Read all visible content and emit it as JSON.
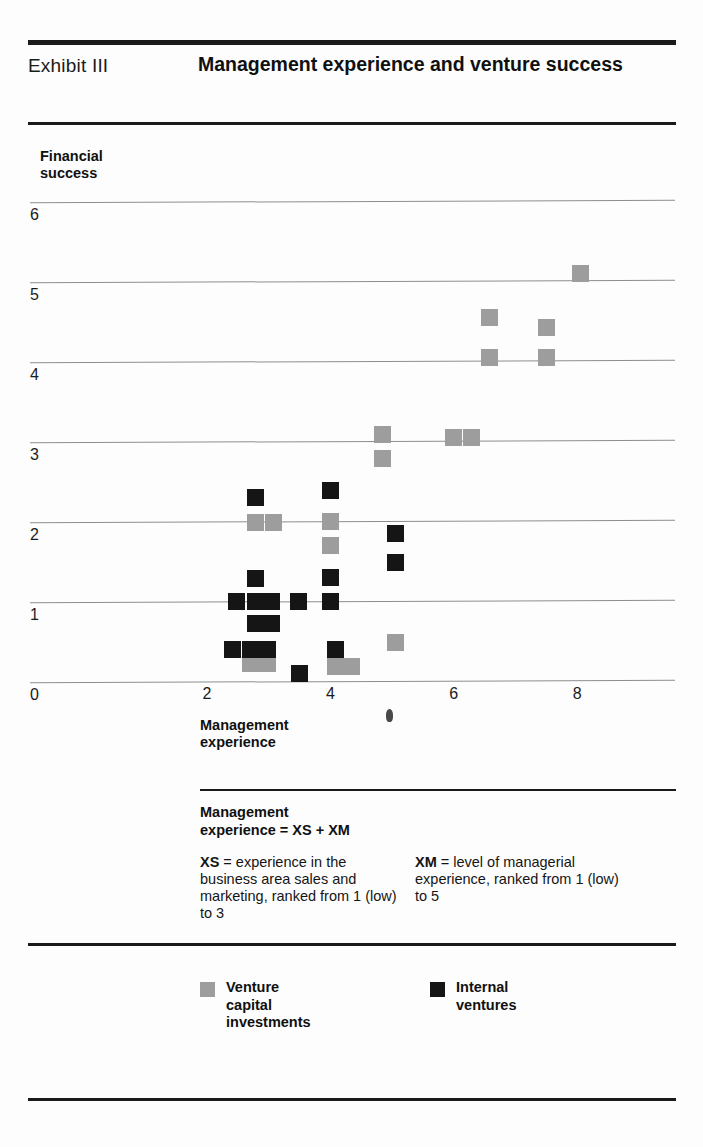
{
  "header": {
    "exhibit_label": "Exhibit III",
    "title": "Management experience and venture success"
  },
  "chart_data": {
    "type": "scatter",
    "title": "Management experience and venture success",
    "xlabel": "Management experience",
    "ylabel": "Financial success",
    "xlim": [
      1.6,
      8.8
    ],
    "ylim": [
      0,
      6.4
    ],
    "x_ticks": [
      "2",
      "4",
      "6",
      "8"
    ],
    "x_tick_values": [
      2,
      4,
      6,
      8
    ],
    "y_ticks": [
      "0",
      "1",
      "2",
      "3",
      "4",
      "5",
      "6"
    ],
    "y_tick_values": [
      0,
      1,
      2,
      3,
      4,
      5,
      6
    ],
    "grid": true,
    "legend_position": "bottom",
    "marker": "square",
    "series": [
      {
        "name": "Venture capital investments",
        "color": "#9d9d9d",
        "points": [
          [
            8.05,
            5.1
          ],
          [
            7.5,
            4.42
          ],
          [
            7.5,
            4.05
          ],
          [
            6.58,
            4.55
          ],
          [
            6.58,
            4.05
          ],
          [
            4.85,
            3.08
          ],
          [
            4.85,
            2.78
          ],
          [
            6.0,
            3.05
          ],
          [
            6.28,
            3.05
          ],
          [
            2.78,
            1.98
          ],
          [
            3.08,
            1.98
          ],
          [
            4.0,
            2.0
          ],
          [
            4.0,
            1.7
          ],
          [
            2.7,
            0.22
          ],
          [
            2.98,
            0.22
          ],
          [
            4.08,
            0.18
          ],
          [
            4.35,
            0.18
          ],
          [
            5.05,
            0.48
          ]
        ]
      },
      {
        "name": "Internal ventures",
        "color": "#151515",
        "points": [
          [
            2.78,
            2.3
          ],
          [
            4.0,
            2.38
          ],
          [
            5.05,
            1.85
          ],
          [
            5.05,
            1.48
          ],
          [
            2.78,
            1.28
          ],
          [
            4.0,
            1.3
          ],
          [
            4.0,
            1.0
          ],
          [
            2.48,
            1.0
          ],
          [
            2.78,
            1.0
          ],
          [
            3.05,
            1.0
          ],
          [
            3.48,
            1.0
          ],
          [
            2.78,
            0.72
          ],
          [
            3.05,
            0.72
          ],
          [
            2.42,
            0.4
          ],
          [
            2.7,
            0.4
          ],
          [
            2.98,
            0.4
          ],
          [
            4.08,
            0.4
          ],
          [
            3.5,
            0.1
          ]
        ]
      }
    ]
  },
  "notes": {
    "heading": "Management\nexperience = XS + XM",
    "xs_key": "XS",
    "xs_text": " = experience in the business area sales and marketing, ranked from 1 (low) to 3",
    "xm_key": "XM",
    "xm_text": " = level of managerial experience, ranked from 1 (low) to 5"
  },
  "legend": {
    "items": [
      {
        "label": "Venture\ncapital\ninvestments",
        "color": "#9d9d9d",
        "swatch": "gray"
      },
      {
        "label": "Internal\nventures",
        "color": "#151515",
        "swatch": "black"
      }
    ]
  }
}
